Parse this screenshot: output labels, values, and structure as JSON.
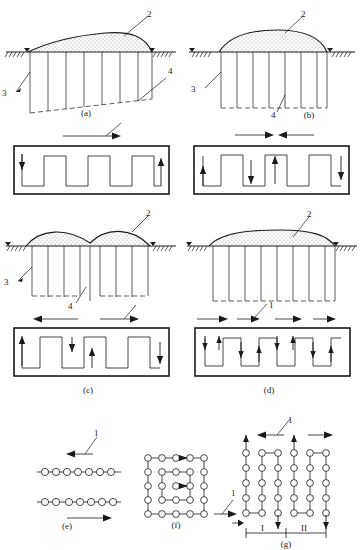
{
  "figure": {
    "title_partial": "",
    "background_color": "#ffffff",
    "line_color": "#1a1a1a",
    "fill_color": "#f2f2f2",
    "width": 361,
    "height": 550
  },
  "legend_numbers": {
    "1": "1",
    "2": "2",
    "3": "3",
    "4": "4"
  },
  "roman_numerals": {
    "one": "I",
    "two": "II"
  },
  "panels": [
    {
      "id": "a",
      "caption": "(a)",
      "type": "profile-with-box",
      "profile_shape": "single-asymmetric-mound",
      "labels": [
        "2",
        "3",
        "4",
        "1"
      ],
      "top_arrows": [
        {
          "direction": "right",
          "label": "1"
        }
      ],
      "box_arrows": [
        {
          "direction": "down",
          "position": "left"
        },
        {
          "direction": "up",
          "position": "right"
        }
      ],
      "wave_periods": 3,
      "piles": 7
    },
    {
      "id": "b",
      "caption": "(b)",
      "type": "profile-with-box",
      "profile_shape": "single-symmetric-mound",
      "labels": [
        "2",
        "3",
        "4"
      ],
      "top_arrows": [
        {
          "direction": "right",
          "label": ""
        },
        {
          "direction": "left",
          "label": ""
        }
      ],
      "box_arrows": [
        {
          "direction": "up",
          "position": "1"
        },
        {
          "direction": "down",
          "position": "2"
        },
        {
          "direction": "up",
          "position": "3"
        },
        {
          "direction": "down",
          "position": "4"
        }
      ],
      "wave_periods": 3,
      "piles": 7
    },
    {
      "id": "c",
      "caption": "(c)",
      "type": "profile-with-box",
      "profile_shape": "double-mound-with-central-dip",
      "labels": [
        "2",
        "3",
        "4",
        "1"
      ],
      "top_arrows": [
        {
          "direction": "left",
          "label": ""
        },
        {
          "direction": "right",
          "label": "1"
        }
      ],
      "box_arrows": [
        {
          "direction": "up",
          "position": "1"
        },
        {
          "direction": "down",
          "position": "2"
        },
        {
          "direction": "up",
          "position": "3"
        },
        {
          "direction": "down",
          "position": "4"
        }
      ],
      "wave_periods": 3,
      "piles": 8
    },
    {
      "id": "d",
      "caption": "(d)",
      "type": "profile-with-box",
      "profile_shape": "flat-wide-mound",
      "labels": [
        "2",
        "1"
      ],
      "top_arrows": [
        {
          "direction": "right",
          "label": ""
        },
        {
          "direction": "right",
          "label": "1"
        },
        {
          "direction": "right",
          "label": ""
        },
        {
          "direction": "right",
          "label": ""
        }
      ],
      "box_arrows": [
        {
          "direction": "down",
          "position": "1"
        },
        {
          "direction": "up",
          "position": "2"
        },
        {
          "direction": "down",
          "position": "3"
        },
        {
          "direction": "up",
          "position": "4"
        },
        {
          "direction": "down",
          "position": "5"
        },
        {
          "direction": "up",
          "position": "6"
        },
        {
          "direction": "down",
          "position": "7"
        },
        {
          "direction": "up",
          "position": "8"
        }
      ],
      "wave_periods": 4,
      "piles": 8
    },
    {
      "id": "e",
      "caption": "(e)",
      "type": "circle-rows",
      "labels": [
        "1"
      ],
      "rows": 2,
      "circles_per_row": 8,
      "arrows": [
        {
          "direction": "left",
          "label": "1",
          "row": "above-top"
        },
        {
          "direction": "right",
          "label": "",
          "row": "below-bottom"
        }
      ]
    },
    {
      "id": "f",
      "caption": "(f)",
      "type": "circle-grid",
      "labels": [
        "1"
      ],
      "grid_rows": 5,
      "grid_cols": 5,
      "arrows": [
        {
          "direction": "right",
          "label": ""
        },
        {
          "direction": "right",
          "label": ""
        },
        {
          "direction": "right",
          "label": "1"
        }
      ]
    },
    {
      "id": "g",
      "caption": "(g)",
      "type": "circle-columns",
      "labels": [
        "1",
        "I",
        "II"
      ],
      "columns": 6,
      "circles_per_column": 5,
      "arrows": [
        {
          "direction": "up",
          "label": ""
        },
        {
          "direction": "left",
          "label": "1"
        },
        {
          "direction": "up",
          "label": ""
        },
        {
          "direction": "right",
          "label": ""
        },
        {
          "direction": "down",
          "label": ""
        },
        {
          "direction": "down",
          "label": ""
        }
      ],
      "dimension_labels": [
        "I",
        "II"
      ]
    }
  ]
}
